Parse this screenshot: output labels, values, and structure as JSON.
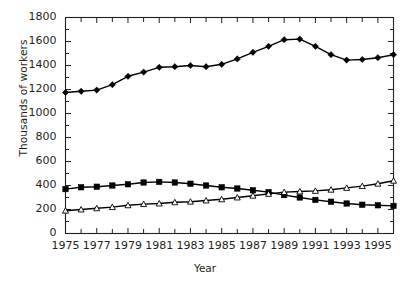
{
  "chart_data": {
    "type": "line",
    "title": "",
    "xlabel": "Year",
    "ylabel": "Thousands of workers",
    "xlim": [
      1975,
      1996
    ],
    "ylim": [
      0,
      1800
    ],
    "grid": false,
    "legend": "none",
    "x": [
      1975,
      1976,
      1977,
      1978,
      1979,
      1980,
      1981,
      1982,
      1983,
      1984,
      1985,
      1986,
      1987,
      1988,
      1989,
      1990,
      1991,
      1992,
      1993,
      1994,
      1995,
      1996
    ],
    "xtick_labels": [
      "1975",
      "1977",
      "1979",
      "1981",
      "1983",
      "1985",
      "1987",
      "1989",
      "1991",
      "1993",
      "1995"
    ],
    "xtick_values": [
      1975,
      1977,
      1979,
      1981,
      1983,
      1985,
      1987,
      1989,
      1991,
      1993,
      1995
    ],
    "ytick_labels": [
      "0",
      "200",
      "400",
      "600",
      "800",
      "1000",
      "1200",
      "1400",
      "1600",
      "1800"
    ],
    "ytick_values": [
      0,
      200,
      400,
      600,
      800,
      1000,
      1200,
      1400,
      1600,
      1800
    ],
    "series": [
      {
        "name": "series-diamond",
        "marker": "filled-diamond",
        "color": "#000000",
        "values": [
          1175,
          1185,
          1195,
          1240,
          1310,
          1345,
          1385,
          1390,
          1400,
          1390,
          1410,
          1455,
          1510,
          1560,
          1615,
          1620,
          1560,
          1490,
          1445,
          1450,
          1465,
          1490
        ]
      },
      {
        "name": "series-square",
        "marker": "filled-square",
        "color": "#000000",
        "values": [
          370,
          385,
          390,
          400,
          410,
          425,
          430,
          425,
          415,
          400,
          385,
          375,
          360,
          345,
          320,
          300,
          280,
          265,
          250,
          240,
          235,
          230
        ]
      },
      {
        "name": "series-triangle",
        "marker": "open-triangle",
        "color": "#000000",
        "values": [
          190,
          200,
          210,
          220,
          235,
          245,
          250,
          260,
          265,
          275,
          285,
          300,
          315,
          330,
          345,
          350,
          355,
          365,
          380,
          395,
          415,
          440
        ]
      }
    ]
  }
}
